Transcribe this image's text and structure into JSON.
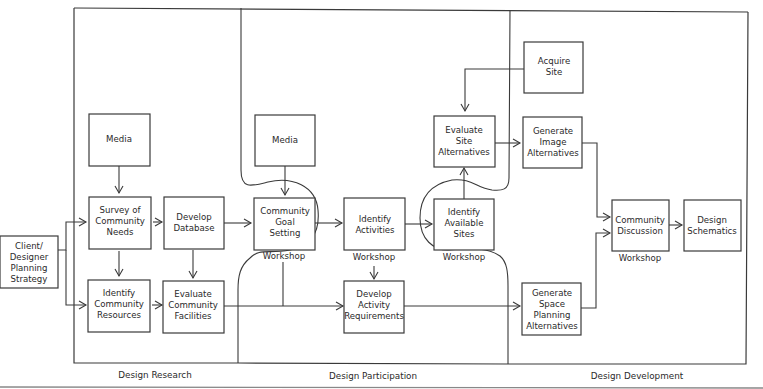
{
  "diagram": {
    "type": "flowchart",
    "phases": [
      {
        "id": "research",
        "label": "Design Research"
      },
      {
        "id": "participation",
        "label": "Design Participation"
      },
      {
        "id": "development",
        "label": "Design Development"
      }
    ],
    "workshop_label": "Workshop",
    "nodes": {
      "client": {
        "lines": [
          "Client/",
          "Designer",
          "Planning",
          "Strategy"
        ]
      },
      "media1": {
        "lines": [
          "Media"
        ]
      },
      "survey": {
        "lines": [
          "Survey of",
          "Community",
          "Needs"
        ]
      },
      "database": {
        "lines": [
          "Develop",
          "Database"
        ]
      },
      "resources": {
        "lines": [
          "Identify",
          "Community",
          "Resources"
        ]
      },
      "facilities": {
        "lines": [
          "Evaluate",
          "Community",
          "Facilities"
        ]
      },
      "media2": {
        "lines": [
          "Media"
        ]
      },
      "goal": {
        "lines": [
          "Community",
          "Goal",
          "Setting"
        ]
      },
      "activities": {
        "lines": [
          "Identify",
          "Activities"
        ]
      },
      "requirements": {
        "lines": [
          "Develop",
          "Activity",
          "Requirements"
        ]
      },
      "evalsite": {
        "lines": [
          "Evaluate",
          "Site",
          "Alternatives"
        ]
      },
      "sites": {
        "lines": [
          "Identify",
          "Available",
          "Sites"
        ]
      },
      "acquire": {
        "lines": [
          "Acquire",
          "Site"
        ]
      },
      "image": {
        "lines": [
          "Generate",
          "Image",
          "Alternatives"
        ]
      },
      "space": {
        "lines": [
          "Generate",
          "Space",
          "Planning",
          "Alternatives"
        ]
      },
      "discussion": {
        "lines": [
          "Community",
          "Discussion"
        ]
      },
      "schematics": {
        "lines": [
          "Design",
          "Schematics"
        ]
      }
    },
    "workshops": [
      "goal",
      "activities",
      "sites",
      "discussion"
    ],
    "edges": [
      {
        "from": "client",
        "to": "survey"
      },
      {
        "from": "client",
        "to": "resources"
      },
      {
        "from": "media1",
        "to": "survey"
      },
      {
        "from": "survey",
        "to": "database"
      },
      {
        "from": "survey",
        "to": "resources"
      },
      {
        "from": "database",
        "to": "facilities"
      },
      {
        "from": "resources",
        "to": "facilities"
      },
      {
        "from": "database",
        "to": "goal"
      },
      {
        "from": "facilities",
        "to": "requirements"
      },
      {
        "from": "goal",
        "to": "requirements"
      },
      {
        "from": "media2",
        "to": "goal"
      },
      {
        "from": "goal",
        "to": "activities"
      },
      {
        "from": "activities",
        "to": "requirements"
      },
      {
        "from": "activities",
        "to": "sites"
      },
      {
        "from": "sites",
        "to": "evalsite"
      },
      {
        "from": "acquire",
        "to": "evalsite"
      },
      {
        "from": "evalsite",
        "to": "image"
      },
      {
        "from": "requirements",
        "to": "space"
      },
      {
        "from": "image",
        "to": "discussion"
      },
      {
        "from": "space",
        "to": "discussion"
      },
      {
        "from": "discussion",
        "to": "schematics"
      }
    ]
  }
}
